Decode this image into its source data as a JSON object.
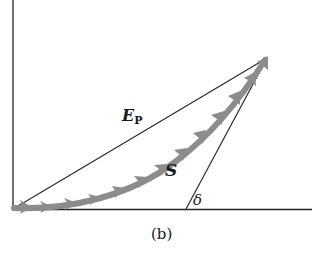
{
  "labels": {
    "ep_main": "E",
    "ep_sub": "P",
    "s": "S",
    "delta": "δ",
    "caption": "(b)"
  },
  "colors": {
    "axis": "#222222",
    "line": "#2a2a2a",
    "curve": "#8c8c8c"
  }
}
